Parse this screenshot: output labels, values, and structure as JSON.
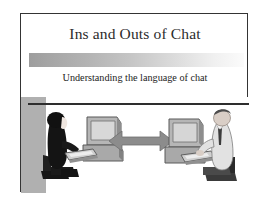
{
  "slide": {
    "title": "Ins and Outs of Chat",
    "subtitle": "Understanding the language of chat",
    "colors": {
      "frame_border": "#343434",
      "background": "#ffffff",
      "title_text": "#2b2b2b",
      "subtitle_text": "#1c1c1c",
      "bar_gradient_start": "#9d9d9d",
      "bar_gradient_end": "#fbfbfb",
      "picture_band": "#b0b0b0",
      "arrow": "#8c8c8c",
      "person_left": "#1a1a1a",
      "person_right": "#d8d8d8",
      "computer": "#a8a8a8"
    },
    "picture": {
      "alt": "Two people seated at computers connected by a double-headed arrow",
      "left_figure": "woman-at-computer",
      "right_figure": "man-at-computer",
      "connector": "double-headed-arrow"
    }
  }
}
